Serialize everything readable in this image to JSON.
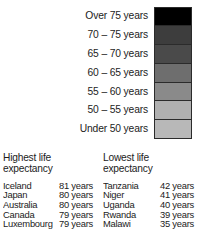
{
  "legend": {
    "name": "life-expectancy-legend",
    "rows": [
      {
        "label": "Over 75 years",
        "color": "#000000"
      },
      {
        "label": "70 – 75 years",
        "color": "#3d3d3d"
      },
      {
        "label": "65 – 70 years",
        "color": "#4a4a4a"
      },
      {
        "label": "60 – 65 years",
        "color": "#6e6e6e"
      },
      {
        "label": "55 – 60 years",
        "color": "#8a8a8a"
      },
      {
        "label": "50 – 55 years",
        "color": "#b0b0b0"
      },
      {
        "label": "Under 50 years",
        "color": "#b8b8b8"
      }
    ]
  },
  "tables": {
    "highest": {
      "title": "Highest life\nexpectancy",
      "rows": [
        {
          "country": "Iceland",
          "value": "81 years"
        },
        {
          "country": "Japan",
          "value": "80 years"
        },
        {
          "country": "Australia",
          "value": "80 years"
        },
        {
          "country": "Canada",
          "value": "79 years"
        },
        {
          "country": "Luxembourg",
          "value": "79 years"
        }
      ]
    },
    "lowest": {
      "title": "Lowest life\nexpectancy",
      "rows": [
        {
          "country": "Tanzania",
          "value": "42 years"
        },
        {
          "country": "Niger",
          "value": "41 years"
        },
        {
          "country": "Uganda",
          "value": "40 years"
        },
        {
          "country": "Rwanda",
          "value": "39 years"
        },
        {
          "country": "Malawi",
          "value": "35 years"
        }
      ]
    }
  },
  "chart_data": {
    "type": "table",
    "legend_bins": [
      {
        "label": "Over 75 years",
        "min": 75,
        "max": null,
        "color": "#000000"
      },
      {
        "label": "70 – 75 years",
        "min": 70,
        "max": 75,
        "color": "#3d3d3d"
      },
      {
        "label": "65 – 70 years",
        "min": 65,
        "max": 70,
        "color": "#4a4a4a"
      },
      {
        "label": "60 – 65 years",
        "min": 60,
        "max": 65,
        "color": "#6e6e6e"
      },
      {
        "label": "55 – 60 years",
        "min": 55,
        "max": 60,
        "color": "#8a8a8a"
      },
      {
        "label": "50 – 55 years",
        "min": 50,
        "max": 55,
        "color": "#b0b0b0"
      },
      {
        "label": "Under 50 years",
        "min": null,
        "max": 50,
        "color": "#b8b8b8"
      }
    ],
    "highest_life_expectancy": {
      "categories": [
        "Iceland",
        "Japan",
        "Australia",
        "Canada",
        "Luxembourg"
      ],
      "values": [
        81,
        80,
        80,
        79,
        79
      ],
      "unit": "years"
    },
    "lowest_life_expectancy": {
      "categories": [
        "Tanzania",
        "Niger",
        "Uganda",
        "Rwanda",
        "Malawi"
      ],
      "values": [
        42,
        41,
        40,
        39,
        35
      ],
      "unit": "years"
    }
  }
}
